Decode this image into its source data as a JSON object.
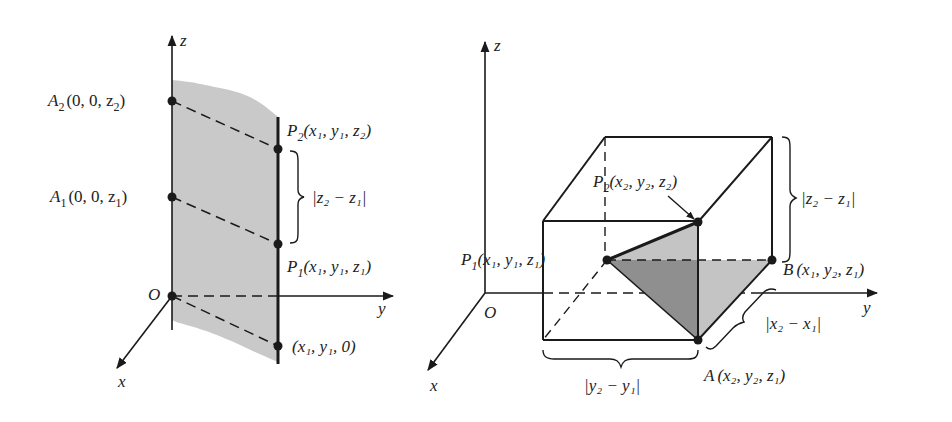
{
  "figure_left": {
    "axes": {
      "z": "z",
      "y": "y",
      "x": "x",
      "origin": "O"
    },
    "points": {
      "A2": {
        "name": "A",
        "sub": "2",
        "coords": "(0, 0, z",
        "coord_sub": "2",
        "close": ")"
      },
      "A1": {
        "name": "A",
        "sub": "1",
        "coords": "(0, 0, z",
        "coord_sub": "1",
        "close": ")"
      },
      "P2": {
        "name": "P",
        "sub": "2",
        "text": "(x₁, y₁, z₂)"
      },
      "P1": {
        "name": "P",
        "sub": "1",
        "text": "(x₁, y₁, z₁)"
      },
      "base": {
        "text": "(x₁, y₁, 0)"
      }
    },
    "brace_label": "|z₂ − z₁|"
  },
  "figure_right": {
    "axes": {
      "z": "z",
      "y": "y",
      "x": "x",
      "origin": "O"
    },
    "points": {
      "P2": {
        "name": "P",
        "sub": "2",
        "text": "(x₂, y₂, z₂)"
      },
      "P1": {
        "name": "P",
        "sub": "1",
        "text": "(x₁, y₁, z₁)"
      },
      "B": {
        "name": "B",
        "text": "(x₁, y₂, z₁)"
      },
      "A": {
        "name": "A",
        "text": "(x₂, y₂, z₁)"
      }
    },
    "brace_labels": {
      "z": "|z₂ − z₁|",
      "x": "|x₂ − x₁|",
      "y": "|y₂ − y₁|"
    }
  },
  "colors": {
    "ink": "#1a1a1a",
    "plane_fill": "#c9c9c9",
    "triangle_dark": "#8f8f8f",
    "triangle_light": "#c4c4c4"
  }
}
